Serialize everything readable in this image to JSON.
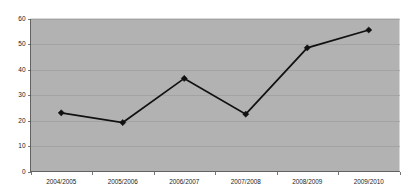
{
  "chart_data": {
    "type": "line",
    "title": "",
    "subtitle": "",
    "xlabel": "",
    "ylabel": "",
    "categories": [
      "2004/2005",
      "2005/2006",
      "2006/2007",
      "2007/2008",
      "2008/2009",
      "2009/2010"
    ],
    "values": [
      23,
      19.2,
      36.5,
      22.5,
      48.5,
      55.5
    ],
    "series": [
      {
        "name": "",
        "values": [
          23,
          19.2,
          36.5,
          22.5,
          48.5,
          55.5
        ]
      }
    ],
    "ylim": [
      0,
      60
    ],
    "ytick_labels": [
      "0",
      "10",
      "20",
      "30",
      "40",
      "50",
      "60"
    ],
    "ytick_values": [
      0,
      10,
      20,
      30,
      40,
      50,
      60
    ],
    "grid": true,
    "grid_axis": "y",
    "legend": false,
    "legend_position": "none",
    "marker": "diamond",
    "line_color": "#111111",
    "marker_color": "#111111",
    "plot_background_color": "#b2b2b2",
    "figure_background_color": "#ffffff",
    "gridline_color": "#9a9a9a",
    "axis_color": "#555555",
    "tick_label_color": "#1a1a1a",
    "annotations": []
  }
}
